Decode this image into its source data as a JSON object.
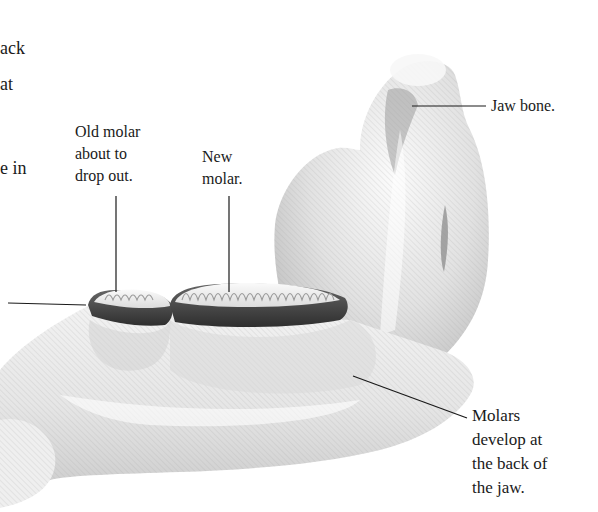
{
  "figure": {
    "colors": {
      "background": "#ffffff",
      "bone_light": "#f4f4f4",
      "bone_shadow": "#b8b8b8",
      "gum_band": "#4a4a4a",
      "leader_line": "#1a1a1a",
      "text": "#1a1a1a"
    }
  },
  "cut_off_text": {
    "lines": [
      "ack",
      "at",
      "",
      "e in"
    ]
  },
  "labels": {
    "old_molar": {
      "text": "Old molar\nabout to\ndrop out."
    },
    "new_molar": {
      "text": "New\nmolar."
    },
    "jaw_bone": {
      "text": "Jaw bone."
    },
    "molars_develop": {
      "text": "Molars\ndevelop at\nthe back of\nthe jaw."
    }
  }
}
